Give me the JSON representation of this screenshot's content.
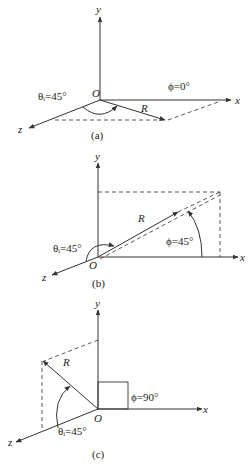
{
  "figures": [
    {
      "id": "a",
      "caption": "(a)",
      "axis_labels": {
        "x": "x",
        "y": "y",
        "z": "z"
      },
      "origin_label": "O",
      "vector_label": "R",
      "theta_label": "θᵢ=45°",
      "phi_label": "ϕ=0°"
    },
    {
      "id": "b",
      "caption": "(b)",
      "axis_labels": {
        "x": "x",
        "y": "y",
        "z": "z"
      },
      "origin_label": "O",
      "vector_label": "R",
      "theta_label": "θᵢ=45°",
      "phi_label": "ϕ=45°"
    },
    {
      "id": "c",
      "caption": "(c)",
      "axis_labels": {
        "x": "x",
        "y": "y",
        "z": "z"
      },
      "origin_label": "O",
      "vector_label": "R",
      "theta_label": "θᵢ=45°",
      "phi_label": "ϕ=90°"
    }
  ]
}
